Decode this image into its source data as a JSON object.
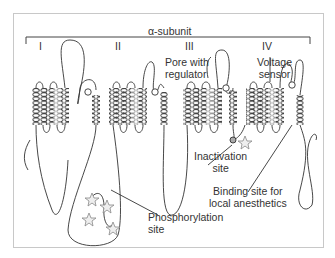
{
  "figure": {
    "title": "α-subunit",
    "domains": [
      {
        "label": "I"
      },
      {
        "label": "II"
      },
      {
        "label": "III"
      },
      {
        "label": "IV"
      }
    ],
    "annotations": {
      "pore": {
        "line1": "Pore with",
        "line2": "regulator"
      },
      "voltage_sensor": {
        "line1": "Voltage",
        "line2": "sensor"
      },
      "inactivation": {
        "line1": "Inactivation",
        "line2": "site"
      },
      "binding_site": {
        "line1": "Binding site for",
        "line2": "local anesthetics"
      },
      "phosphorylation": {
        "line1": "Phosphorylation",
        "line2": "site"
      }
    },
    "colors": {
      "line": "#333333",
      "helix": "#444444",
      "helix_voltage_sensor": "#999999",
      "frame": "#c8c8c8",
      "star": "#888888"
    }
  }
}
